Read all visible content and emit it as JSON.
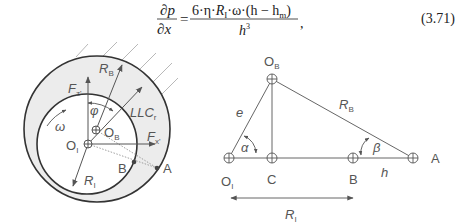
{
  "equation": {
    "lhs_num": "∂p",
    "lhs_den": "∂x",
    "equals": "=",
    "rhs_num_parts": [
      "6·η·",
      "R",
      "I",
      "·ω·(h − h",
      "m",
      ")"
    ],
    "rhs_den_base": "h",
    "rhs_den_exp": "3",
    "trailing": ",",
    "number": "(3.71)"
  },
  "left_diagram": {
    "labels": {
      "fz": {
        "base": "F",
        "sub": "z'"
      },
      "rb": {
        "base": "R",
        "sub": "B"
      },
      "phi": "φ",
      "llc": {
        "base": "LLC",
        "sub": "r"
      },
      "omega": "ω",
      "ob": {
        "base": "O",
        "sub": "B"
      },
      "oi": {
        "base": "O",
        "sub": "I"
      },
      "fx": {
        "base": "F",
        "sub": "x'"
      },
      "b": "B",
      "a": "A",
      "ri": {
        "base": "R",
        "sub": "I"
      }
    },
    "colors": {
      "ring_fill": "#ececec",
      "stroke": "#333333",
      "arrow": "#555555",
      "dotted": "#888888"
    }
  },
  "right_diagram": {
    "labels": {
      "ob": {
        "base": "O",
        "sub": "B"
      },
      "e": "e",
      "rb": {
        "base": "R",
        "sub": "B"
      },
      "alpha": "α",
      "beta": "β",
      "oi": {
        "base": "O",
        "sub": "I"
      },
      "c": "C",
      "b": "B",
      "a": "A",
      "h": "h",
      "ri": {
        "base": "R",
        "sub": "I"
      }
    }
  }
}
